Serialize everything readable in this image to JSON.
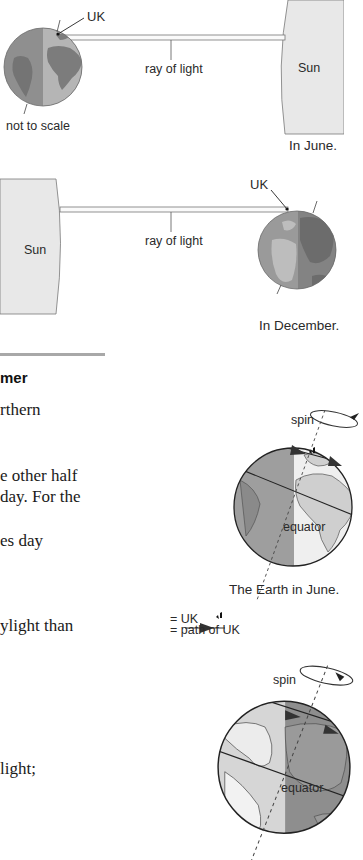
{
  "diagram_june_sun": {
    "uk_label": "UK",
    "ray_label": "ray of light",
    "sun_label": "Sun",
    "scale_note": "not to scale",
    "caption": "In June."
  },
  "diagram_december_sun": {
    "uk_label": "UK",
    "ray_label": "ray of light",
    "sun_label": "Sun",
    "caption": "In December."
  },
  "section": {
    "heading_fragment": "mer",
    "text_lines": [
      "rthern",
      "e other half",
      "day. For the",
      "es day",
      "ylight than",
      "light;"
    ]
  },
  "globe_june": {
    "spin_label": "spin",
    "equator_label": "equator",
    "caption": "The Earth in June."
  },
  "legend": {
    "uk_entry": "= UK",
    "path_entry": "= path of UK"
  },
  "globe_december": {
    "spin_label": "spin",
    "equator_label": "equator"
  },
  "colors": {
    "sun_fill": "#e6e6e6",
    "globe_dark": "#8a8a8a",
    "globe_light": "#b8b8b8",
    "land_dark": "#6f6f6f",
    "land_light": "#d8d8d8",
    "divider": "#a8a8a8"
  }
}
